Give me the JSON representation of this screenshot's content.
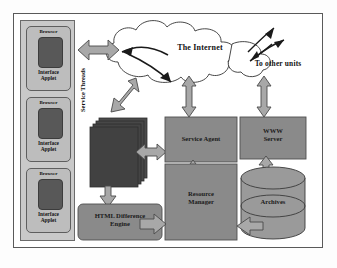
{
  "diagram": {
    "frame": {
      "border_color": "#5a5a5a",
      "background": "#ffffff"
    },
    "palette": {
      "page_background": "#fdfdfd",
      "sidebar_fill": "#c9c9c9",
      "browser_fill": "#bdbdbd",
      "browser_screen_fill": "#585858",
      "thread_stack_fill": "#4a4a4a",
      "box_fill": "#8a8a8a",
      "cylinder_fill": "#9a9a9a",
      "arrow_fill": "#a8a8a8",
      "arrow_stroke": "#4a4a4a",
      "line_color": "#2b2b2b",
      "text_color": "#111111"
    },
    "clients": {
      "container_name": "browser-stack",
      "items": [
        {
          "title": "Browser",
          "applet": "Interface\nApplet"
        },
        {
          "title": "Browser",
          "applet": "Interface\nApplet"
        },
        {
          "title": "Browser",
          "applet": "Interface\nApplet"
        }
      ]
    },
    "cloud": {
      "label": "The Internet",
      "external_label": "To other units"
    },
    "nodes": [
      {
        "id": "service-threads",
        "label": "Service Threads",
        "orientation": "vertical",
        "shape": "stack"
      },
      {
        "id": "service-agent",
        "label": "Service Agent",
        "shape": "rect"
      },
      {
        "id": "www-server",
        "label": "WWW\nServer",
        "shape": "rect"
      },
      {
        "id": "resource-manager",
        "label": "Resource\nManager",
        "shape": "rect"
      },
      {
        "id": "html-diff-engine",
        "label": "HTML Difference\nEngine",
        "shape": "rounded-rect"
      },
      {
        "id": "archives",
        "label": "Archives",
        "shape": "cylinder"
      }
    ],
    "connections": [
      {
        "from": "browser-stack",
        "to": "cloud",
        "type": "double-arrow",
        "direction": "horizontal"
      },
      {
        "from": "cloud",
        "to": "service-threads",
        "type": "double-arrow",
        "direction": "diagonal"
      },
      {
        "from": "cloud",
        "to": "service-agent",
        "type": "double-arrow",
        "direction": "vertical"
      },
      {
        "from": "cloud",
        "to": "www-server",
        "type": "double-arrow",
        "direction": "vertical"
      },
      {
        "from": "service-threads",
        "to": "service-agent",
        "type": "double-arrow",
        "direction": "horizontal"
      },
      {
        "from": "service-threads",
        "to": "html-diff-engine",
        "type": "single-arrow",
        "direction": "down"
      },
      {
        "from": "service-agent",
        "to": "resource-manager",
        "type": "double-arrow",
        "direction": "vertical"
      },
      {
        "from": "html-diff-engine",
        "to": "resource-manager",
        "type": "single-arrow",
        "direction": "right"
      },
      {
        "from": "www-server",
        "to": "archives",
        "type": "double-arrow",
        "direction": "vertical"
      },
      {
        "from": "archives",
        "to": "resource-manager",
        "type": "single-arrow",
        "direction": "left"
      },
      {
        "from": "cloud",
        "to": "external",
        "type": "thin-arrows",
        "direction": "diagonal"
      }
    ]
  }
}
